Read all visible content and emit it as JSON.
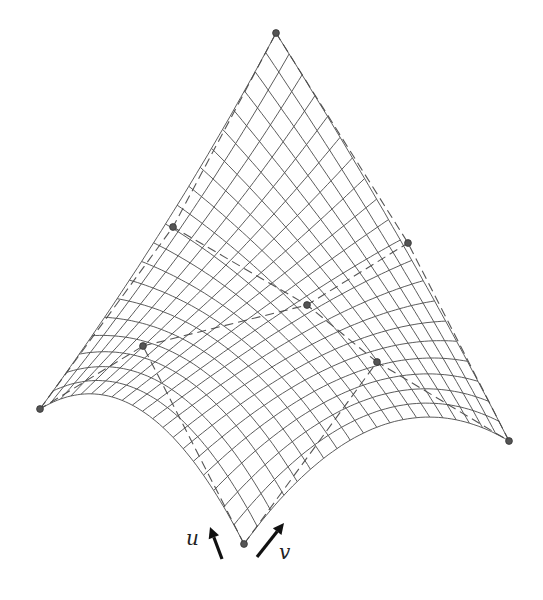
{
  "figure": {
    "type": "biquadratic Bezier surface with control net",
    "colors": {
      "background": "#ffffff",
      "mesh": "#4a4a4a",
      "control_net": "#555555",
      "control_point": "#555555",
      "arrows": "#111111"
    },
    "control_points": [
      [
        [
          244,
          544
        ],
        [
          377,
          362
        ],
        [
          509,
          441
        ]
      ],
      [
        [
          143,
          346
        ],
        [
          307,
          305
        ],
        [
          408,
          243
        ]
      ],
      [
        [
          40,
          409
        ],
        [
          173,
          227
        ],
        [
          276,
          33
        ]
      ]
    ],
    "mesh_divisions": 20,
    "axes": {
      "u": {
        "label": "u",
        "arrow_from": [
          222,
          559
        ],
        "arrow_to": [
          210,
          527
        ],
        "label_pos": [
          186,
          545
        ]
      },
      "v": {
        "label": "v",
        "arrow_from": [
          257,
          557
        ],
        "arrow_to": [
          284,
          523
        ],
        "label_pos": [
          279,
          559
        ]
      }
    }
  }
}
